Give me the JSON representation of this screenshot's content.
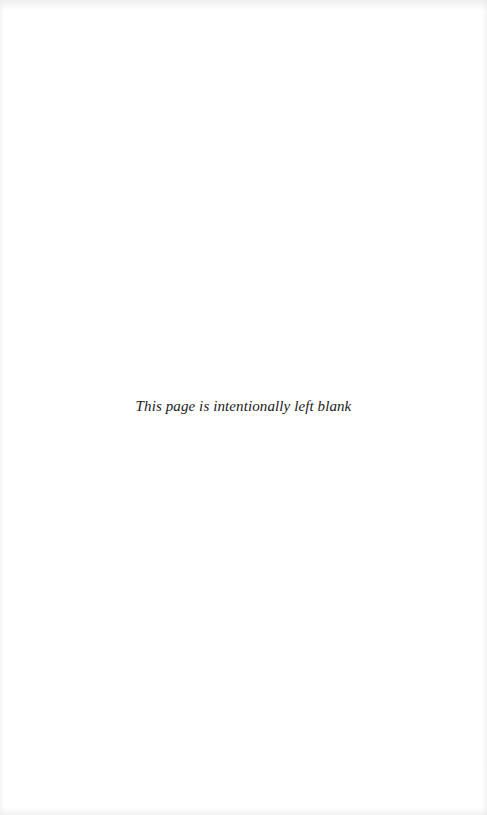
{
  "page": {
    "notice": "This page is intentionally left blank"
  }
}
